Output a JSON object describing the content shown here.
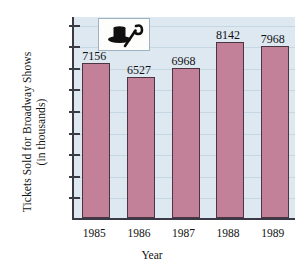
{
  "chart_data": {
    "type": "bar",
    "title": "",
    "xlabel": "Year",
    "ylabel_line1": "Tickets Sold for Broadway Shows",
    "ylabel_line2": "(in thousands)",
    "categories": [
      "1985",
      "1986",
      "1987",
      "1988",
      "1989"
    ],
    "values": [
      7156,
      6527,
      6968,
      8142,
      7968
    ],
    "value_labels": [
      "7156",
      "6527",
      "6968",
      "8142",
      "7968"
    ],
    "ylim": [
      0,
      9400
    ],
    "yticks": [
      1000,
      2000,
      3000,
      4000,
      5000,
      6000,
      7000,
      8000,
      9000
    ],
    "ytick_labels": [
      "1000",
      "2000",
      "3000",
      "4000",
      "5000",
      "6000",
      "7000",
      "8000",
      "9000"
    ],
    "grid": true,
    "legend": "none",
    "colors": {
      "bar_fill": "#c28198",
      "bar_edge": "#4a3540",
      "plot_background": "#dde8f1",
      "gridline": "#c6d7e4",
      "axis": "#3a3a46",
      "text": "#111111",
      "page_background": "#ffffff"
    }
  },
  "inset": {
    "icon_name": "top-hat-and-cane-icon",
    "box_background": "#fdfdfb",
    "glyph_color": "#101010"
  }
}
